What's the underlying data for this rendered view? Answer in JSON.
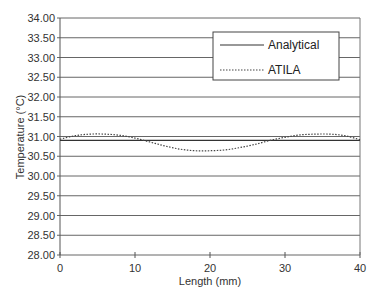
{
  "chart_data": {
    "type": "line",
    "title": "",
    "xlabel": "Length (mm)",
    "ylabel": "Temperature (°C)",
    "xlim": [
      0,
      40
    ],
    "ylim": [
      28.0,
      34.0
    ],
    "x_ticks": [
      "0",
      "10",
      "20",
      "30",
      "40"
    ],
    "y_ticks": [
      "28.00",
      "28.50",
      "29.00",
      "29.50",
      "30.00",
      "30.50",
      "31.00",
      "31.50",
      "32.00",
      "32.50",
      "33.00",
      "33.50",
      "34.00"
    ],
    "grid": "horizontal",
    "legend_position": "upper right",
    "series": [
      {
        "name": "Analytical",
        "style": "solid",
        "x": [
          0,
          5,
          10,
          15,
          20,
          25,
          30,
          35,
          40
        ],
        "values": [
          30.9,
          30.9,
          30.9,
          30.9,
          30.9,
          30.9,
          30.9,
          30.9,
          30.9
        ]
      },
      {
        "name": "ATILA",
        "style": "dotted",
        "x": [
          0,
          2,
          4,
          6,
          8,
          10,
          12,
          14,
          16,
          18,
          20,
          22,
          24,
          26,
          28,
          30,
          32,
          34,
          36,
          38,
          40
        ],
        "values": [
          30.93,
          31.02,
          31.06,
          31.06,
          31.03,
          30.96,
          30.86,
          30.76,
          30.68,
          30.64,
          30.64,
          30.66,
          30.72,
          30.8,
          30.9,
          30.98,
          31.04,
          31.06,
          31.06,
          31.02,
          30.92
        ]
      }
    ]
  },
  "legend": {
    "items": [
      {
        "label": "Analytical"
      },
      {
        "label": "ATILA"
      }
    ]
  },
  "axes": {
    "xlabel": "Length (mm)",
    "ylabel": "Temperature (°C)"
  }
}
